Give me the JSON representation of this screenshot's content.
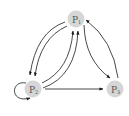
{
  "diagram": {
    "type": "state-transition-graph",
    "colors": {
      "node_fill": "#d6d6d6",
      "edge": "#1a1a1a",
      "label": "#555555",
      "background": "#ffffff"
    },
    "nodes": [
      {
        "id": "P1",
        "label": "P",
        "subscript": "1"
      },
      {
        "id": "P2",
        "label": "P",
        "subscript": "2"
      },
      {
        "id": "P3",
        "label": "P",
        "subscript": "3"
      }
    ],
    "edges": [
      {
        "from": "P1",
        "to": "P2",
        "count": 2
      },
      {
        "from": "P2",
        "to": "P1",
        "count": 2
      },
      {
        "from": "P1",
        "to": "P3",
        "count": 1
      },
      {
        "from": "P3",
        "to": "P1",
        "count": 1
      },
      {
        "from": "P2",
        "to": "P3",
        "count": 1
      },
      {
        "from": "P2",
        "to": "P2",
        "count": 1,
        "self_loop": true
      }
    ]
  }
}
